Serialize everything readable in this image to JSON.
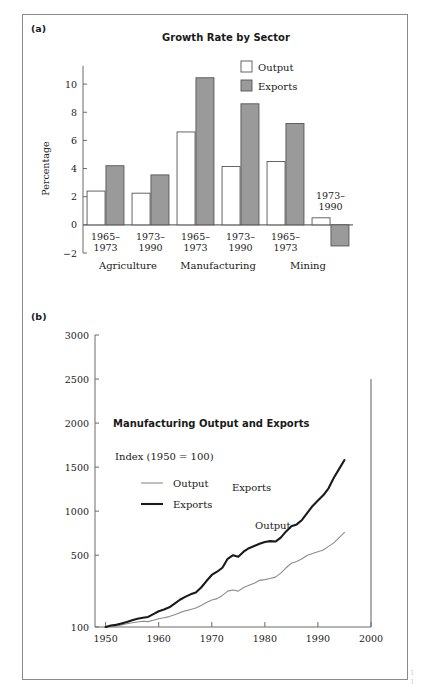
{
  "figure": {
    "panel_a_tag": "(a)",
    "panel_b_tag": "(b)",
    "edge_caption_line1": "1",
    "edge_caption_line2": "1"
  },
  "chart_data": [
    {
      "id": "panel-a",
      "type": "bar",
      "title": "Growth Rate by Sector",
      "xlabel": "",
      "ylabel": "Percentage",
      "ylim": [
        -2,
        11.5
      ],
      "yticks": [
        -2,
        0,
        2,
        4,
        6,
        8,
        10
      ],
      "ytick_labels": [
        "−2",
        "0",
        "2",
        "4",
        "6",
        "8",
        "10"
      ],
      "grid": false,
      "legend_position": "top-right",
      "legend": [
        "Output",
        "Exports"
      ],
      "colors": {
        "output": "#ffffff",
        "exports": "#9a9a9a",
        "outline": "#555555"
      },
      "sectors": [
        "Agriculture",
        "Manufacturing",
        "Mining"
      ],
      "categories": [
        "1965–\n1973",
        "1973–\n1990",
        "1965–\n1973",
        "1973–\n1990",
        "1965–\n1973",
        "1973–\n1990"
      ],
      "category_line1": [
        "1965–",
        "1973–",
        "1965–",
        "1973–",
        "1965–",
        "1973–"
      ],
      "category_line2": [
        "1973",
        "1990",
        "1973",
        "1990",
        "1973",
        "1990"
      ],
      "series": [
        {
          "name": "Output",
          "values": [
            2.4,
            2.25,
            6.6,
            4.15,
            4.5,
            0.5
          ]
        },
        {
          "name": "Exports",
          "values": [
            4.2,
            3.55,
            10.45,
            8.6,
            7.2,
            -1.5
          ]
        }
      ],
      "inline_annotations": [
        {
          "text_line1": "1973–",
          "text_line2": "1990",
          "x_category_index": 5
        }
      ]
    },
    {
      "id": "panel-b",
      "type": "line",
      "title": "Manufacturing Output and Exports",
      "subtitle": "Index (1950 = 100)",
      "xlabel": "",
      "ylabel": "",
      "xlim": [
        1948,
        2000
      ],
      "ylim": [
        100,
        3000
      ],
      "xticks": [
        1950,
        1960,
        1970,
        1980,
        1990,
        2000
      ],
      "xtick_labels": [
        "1950",
        "1960",
        "1970",
        "1980",
        "1990",
        "2000"
      ],
      "yticks": [
        100,
        500,
        1000,
        1500,
        2000,
        2500,
        3000
      ],
      "ytick_labels": [
        "100",
        "500",
        "1000",
        "1500",
        "2000",
        "2500",
        "3000"
      ],
      "y_scale": "log-like",
      "grid": false,
      "legend_position": "inside-left",
      "legend": [
        "Output",
        "Exports"
      ],
      "colors": {
        "output": "#8c8c8c",
        "exports": "#1a1a1a"
      },
      "inline_labels": [
        {
          "text": "Exports",
          "x": 1977.5,
          "y": 1230
        },
        {
          "text": "Output",
          "x": 1981.5,
          "y": 800
        }
      ],
      "series": [
        {
          "name": "Output",
          "x": [
            1950,
            1951,
            1952,
            1953,
            1954,
            1955,
            1956,
            1957,
            1958,
            1959,
            1960,
            1961,
            1962,
            1963,
            1964,
            1965,
            1966,
            1967,
            1968,
            1969,
            1970,
            1971,
            1972,
            1973,
            1974,
            1975,
            1976,
            1977,
            1978,
            1979,
            1980,
            1981,
            1982,
            1983,
            1984,
            1985,
            1986,
            1987,
            1988,
            1989,
            1990,
            1991,
            1992,
            1993,
            1994,
            1995
          ],
          "values": [
            100,
            104,
            106,
            112,
            118,
            124,
            128,
            132,
            130,
            138,
            146,
            152,
            158,
            168,
            180,
            190,
            198,
            206,
            220,
            236,
            250,
            258,
            276,
            300,
            306,
            300,
            320,
            332,
            344,
            360,
            364,
            370,
            378,
            400,
            430,
            455,
            465,
            480,
            500,
            520,
            540,
            560,
            600,
            640,
            700,
            760
          ]
        },
        {
          "name": "Exports",
          "x": [
            1950,
            1951,
            1952,
            1953,
            1954,
            1955,
            1956,
            1957,
            1958,
            1959,
            1960,
            1961,
            1962,
            1963,
            1964,
            1965,
            1966,
            1967,
            1968,
            1969,
            1970,
            1971,
            1972,
            1973,
            1974,
            1975,
            1976,
            1977,
            1978,
            1979,
            1980,
            1981,
            1982,
            1983,
            1984,
            1985,
            1986,
            1987,
            1988,
            1989,
            1990,
            1991,
            1992,
            1993,
            1994,
            1995
          ],
          "values": [
            100,
            108,
            112,
            120,
            128,
            138,
            146,
            152,
            156,
            172,
            188,
            198,
            210,
            230,
            252,
            268,
            282,
            292,
            320,
            356,
            390,
            408,
            430,
            480,
            500,
            492,
            540,
            580,
            605,
            630,
            650,
            660,
            655,
            700,
            770,
            830,
            850,
            900,
            980,
            1060,
            1120,
            1180,
            1260,
            1380,
            1480,
            1580
          ]
        }
      ]
    }
  ]
}
